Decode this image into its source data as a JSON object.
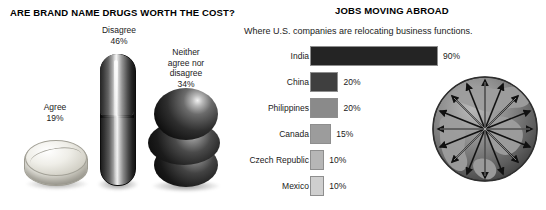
{
  "left_panel": {
    "title": "ARE BRAND NAME DRUGS WORTH THE COST?",
    "items": [
      {
        "label": "Agree",
        "value": "19%",
        "graphic": "round-tablet-pill"
      },
      {
        "label": "Disagree",
        "value": "46%",
        "graphic": "capsule-pill"
      },
      {
        "label": "Neither\nagree nor\ndisagree",
        "value": "34%",
        "graphic": "stacked-spheres-pill"
      }
    ],
    "label_agree_line1": "Agree",
    "label_agree_line2": "19%",
    "label_disagree_line1": "Disagree",
    "label_disagree_line2": "46%",
    "label_neither_line1": "Neither",
    "label_neither_line2": "agree nor",
    "label_neither_line3": "disagree",
    "label_neither_line4": "34%"
  },
  "right_panel": {
    "title": "JOBS MOVING ABROAD",
    "subtitle": "Where U.S. companies are relocating business functions.",
    "globe_icon": "globe-with-radiating-arrows-icon"
  },
  "chart_data": {
    "type": "bar",
    "title": "JOBS MOVING ABROAD",
    "subtitle": "Where U.S. companies are relocating business functions.",
    "orientation": "horizontal",
    "categories": [
      "India",
      "China",
      "Philippines",
      "Canada",
      "Czech Republic",
      "Mexico"
    ],
    "values": [
      90,
      20,
      20,
      15,
      10,
      10
    ],
    "value_labels": [
      "90%",
      "20%",
      "20%",
      "15%",
      "10%",
      "10%"
    ],
    "bar_colors": [
      "#242424",
      "#3f3f3f",
      "#8a8a8a",
      "#9c9c9c",
      "#b6b6b6",
      "#cfcfcf"
    ],
    "xlabel": "",
    "ylabel": "",
    "xlim": [
      0,
      100
    ],
    "grid": false,
    "legend": false
  },
  "chart_data_left": {
    "type": "bar",
    "title": "ARE BRAND NAME DRUGS WORTH THE COST?",
    "categories": [
      "Agree",
      "Disagree",
      "Neither agree nor disagree"
    ],
    "values": [
      19,
      46,
      34
    ],
    "value_labels": [
      "19%",
      "46%",
      "34%"
    ],
    "xlabel": "",
    "ylabel": "",
    "ylim": [
      0,
      50
    ],
    "grid": false,
    "legend": false
  }
}
